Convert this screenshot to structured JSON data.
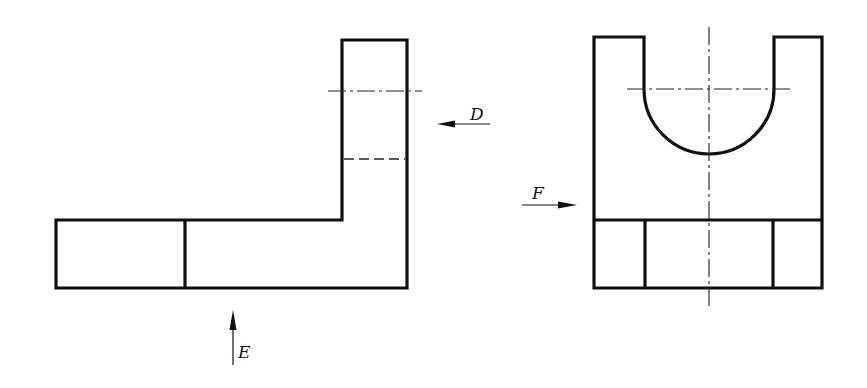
{
  "diagram": {
    "type": "orthographic-projection",
    "views": [
      {
        "id": "front-view",
        "description": "L-shaped part with vertical upright on right, hidden line and centerline in upright"
      },
      {
        "id": "side-view",
        "description": "Block with U-shaped semicircular notch at top and base with two vertical dividers"
      }
    ],
    "view_direction_labels": {
      "D": "D",
      "E": "E",
      "F": "F"
    },
    "colors": {
      "line": "#111111",
      "background": "#ffffff"
    }
  }
}
